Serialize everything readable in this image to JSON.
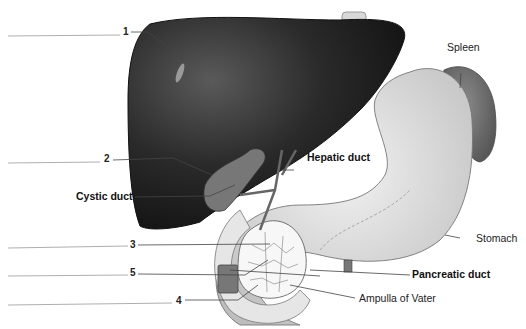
{
  "diagram": {
    "type": "anatomical-illustration",
    "numbered_labels": [
      {
        "number": "1",
        "answer_blank": ""
      },
      {
        "number": "2",
        "answer_blank": ""
      },
      {
        "number": "3",
        "answer_blank": ""
      },
      {
        "number": "5",
        "answer_blank": ""
      },
      {
        "number": "4",
        "answer_blank": ""
      }
    ],
    "text_labels": {
      "spleen": "Spleen",
      "hepatic_duct": "Hepatic duct",
      "cystic_duct": "Cystic duct",
      "stomach": "Stomach",
      "pancreatic_duct": "Pancreatic duct",
      "ampulla": "Ampulla of Vater"
    }
  }
}
